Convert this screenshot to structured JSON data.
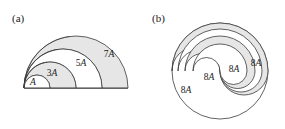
{
  "figure": {
    "background_color": "#ffffff",
    "stroke_color": "#3a3a3a",
    "fill_gray": "#e6e6e6",
    "fill_white": "#ffffff",
    "panels": [
      {
        "id": "a",
        "label": "(a)",
        "label_x": 12,
        "label_y": 22,
        "shape": "nested-semicircles",
        "baseline_y": 88,
        "origin_x": 24,
        "radii": [
          13,
          26,
          39,
          52,
          66,
          78,
          91,
          104
        ],
        "regions": [
          {
            "name": "region-a",
            "label": "A",
            "coefficient": "",
            "letter": "A",
            "fill": "#ffffff",
            "label_x": 33,
            "label_y": 85
          },
          {
            "name": "region-3a",
            "label": "3A",
            "coefficient": "3",
            "letter": "A",
            "fill": "#e6e6e6",
            "label_x": 52,
            "label_y": 76
          },
          {
            "name": "region-5a",
            "label": "5A",
            "coefficient": "5",
            "letter": "A",
            "fill": "#ffffff",
            "label_x": 81,
            "label_y": 66
          },
          {
            "name": "region-7a",
            "label": "7A",
            "coefficient": "7",
            "letter": "A",
            "fill": "#e6e6e6",
            "label_x": 109,
            "label_y": 57
          }
        ]
      },
      {
        "id": "b",
        "label": "(b)",
        "label_x": 152,
        "label_y": 22,
        "shape": "nested-yin-yang-circle",
        "center_x": 220,
        "center_y": 71,
        "radius": 48,
        "regions": [
          {
            "name": "region-8a-1",
            "label": "8A",
            "coefficient": "8",
            "letter": "A",
            "fill": "#ffffff",
            "label_x": 186,
            "label_y": 93
          },
          {
            "name": "region-8a-2",
            "label": "8A",
            "coefficient": "8",
            "letter": "A",
            "fill": "#e6e6e6",
            "label_x": 209,
            "label_y": 80
          },
          {
            "name": "region-8a-3",
            "label": "8A",
            "coefficient": "8",
            "letter": "A",
            "fill": "#ffffff",
            "label_x": 234,
            "label_y": 72
          },
          {
            "name": "region-8a-4",
            "label": "8A",
            "coefficient": "8",
            "letter": "A",
            "fill": "#e6e6e6",
            "label_x": 256,
            "label_y": 66
          }
        ]
      }
    ]
  }
}
